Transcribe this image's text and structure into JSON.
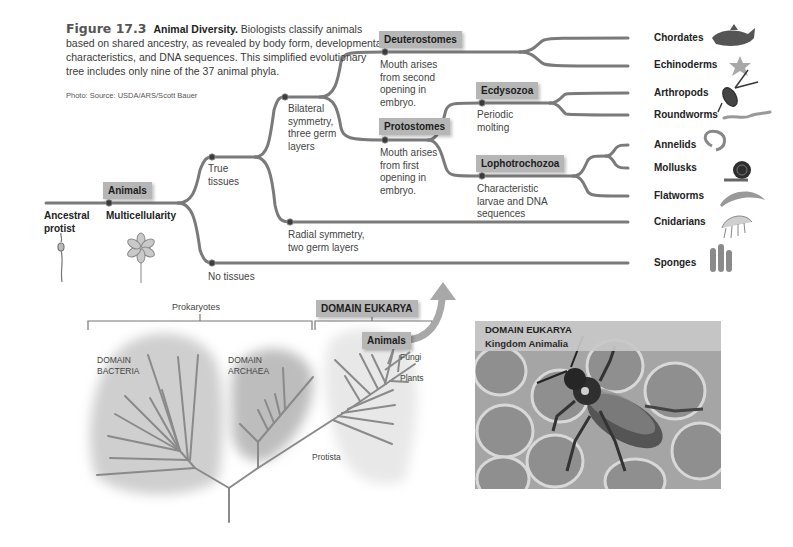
{
  "caption": {
    "figure_number": "Figure 17.3",
    "title": "Animal Diversity.",
    "text": "Biologists classify animals based on shared ancestry, as revealed by body form, developmental characteristics, and DNA sequences. This simplified evolutionary tree includes only nine of the 37 animal phyla.",
    "credit": "Photo: Source: USDA/ARS/Scott Bauer"
  },
  "tree": {
    "root": {
      "label_line1": "Ancestral",
      "label_line2": "protist"
    },
    "animals_box": "Animals",
    "multicellularity": "Multicellularity",
    "true_tissues": {
      "line1": "True",
      "line2": "tissues"
    },
    "bilateral": {
      "line1": "Bilateral",
      "line2": "symmetry,",
      "line3": "three germ",
      "line4": "layers"
    },
    "radial": {
      "line1": "Radial symmetry,",
      "line2": "two germ layers"
    },
    "no_tissues": "No tissues",
    "deuterostomes": {
      "box": "Deuterostomes",
      "line1": "Mouth arises",
      "line2": "from second",
      "line3": "opening in",
      "line4": "embryo."
    },
    "protostomes": {
      "box": "Protostomes",
      "line1": "Mouth arises",
      "line2": "from first",
      "line3": "opening in",
      "line4": "embryo."
    },
    "ecdysozoa": {
      "box": "Ecdysozoa",
      "line1": "Periodic",
      "line2": "molting"
    },
    "lophotrochozoa": {
      "box": "Lophotrochozoa",
      "line1": "Characteristic",
      "line2": "larvae and DNA",
      "line3": "sequences"
    },
    "phyla": [
      "Chordates",
      "Echinoderms",
      "Arthropods",
      "Roundworms",
      "Annelids",
      "Mollusks",
      "Flatworms",
      "Cnidarians",
      "Sponges"
    ]
  },
  "domains": {
    "prokaryotes": "Prokaryotes",
    "eukarya_box": "DOMAIN EUKARYA",
    "bacteria": {
      "line1": "DOMAIN",
      "line2": "BACTERIA"
    },
    "archaea": {
      "line1": "DOMAIN",
      "line2": "ARCHAEA"
    },
    "animals_box": "Animals",
    "fungi": "Fungi",
    "plants": "Plants",
    "protista": "Protista"
  },
  "photo": {
    "line1": "DOMAIN EUKARYA",
    "line2": "Kingdom Animalia"
  },
  "colors": {
    "branch": "#7a7a7a",
    "highlight_box": "#b6b6b6",
    "bacteria_blob": "#cfcfcf",
    "archaea_blob": "#bdbdbd",
    "eukarya_blob": "#e6e6e6"
  }
}
